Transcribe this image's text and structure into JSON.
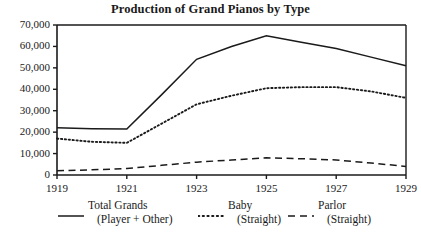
{
  "chart_data": {
    "type": "line",
    "title": "Production of Grand Pianos by Type",
    "xlabel": "",
    "ylabel": "",
    "x": [
      1919,
      1920,
      1921,
      1922,
      1923,
      1924,
      1925,
      1926,
      1927,
      1928,
      1929
    ],
    "xlim": [
      1919,
      1929
    ],
    "ylim": [
      0,
      70000
    ],
    "grid": false,
    "legend_position": "below",
    "xticks": [
      "1919",
      "1921",
      "1923",
      "1925",
      "1927",
      "1929"
    ],
    "xtick_values": [
      1919,
      1921,
      1923,
      1925,
      1927,
      1929
    ],
    "yticks": [
      "0",
      "10,000",
      "20,000",
      "30,000",
      "40,000",
      "50,000",
      "60,000",
      "70,000"
    ],
    "ytick_values": [
      0,
      10000,
      20000,
      30000,
      40000,
      50000,
      60000,
      70000
    ],
    "series": [
      {
        "name": "Total Grands (Player + Other)",
        "style": "solid",
        "color": "#1a1a1a",
        "values": [
          22000,
          21600,
          21500,
          37500,
          54000,
          60000,
          65000,
          62000,
          59000,
          55000,
          51000
        ]
      },
      {
        "name": "Baby (Straight)",
        "style": "dotted",
        "color": "#1a1a1a",
        "values": [
          17000,
          15500,
          15000,
          24000,
          33000,
          37000,
          40500,
          41000,
          41000,
          39000,
          36000
        ]
      },
      {
        "name": "Parlor (Straight)",
        "style": "dashed",
        "color": "#1a1a1a",
        "values": [
          2000,
          2400,
          3000,
          4500,
          6000,
          7000,
          8000,
          7600,
          7000,
          5600,
          4000
        ]
      }
    ]
  },
  "legend": {
    "entries": [
      {
        "line1": "Total Grands",
        "line2": "(Player + Other)",
        "style": "solid"
      },
      {
        "line1": "Baby",
        "line2": "(Straight)",
        "style": "dotted"
      },
      {
        "line1": "Parlor",
        "line2": "(Straight)",
        "style": "dashed"
      }
    ]
  },
  "axis": {
    "plot_left": 57,
    "plot_right": 406,
    "plot_top": 25,
    "plot_bottom": 175
  }
}
